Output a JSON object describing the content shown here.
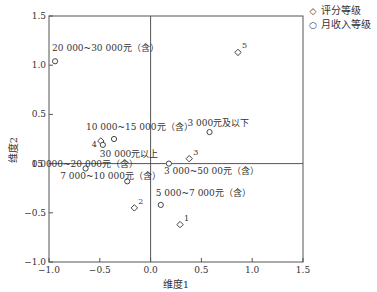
{
  "chart_data": {
    "type": "scatter",
    "title": "",
    "xlabel": "维度1",
    "ylabel": "维度2",
    "xlim": [
      -1.0,
      1.5
    ],
    "ylim": [
      -1.0,
      1.5
    ],
    "xticks": [
      "−1.0",
      "−0.5",
      "0.0",
      "0.5",
      "1.0",
      "1.5"
    ],
    "yticks": [
      "1.5",
      "1.0",
      "0.5",
      "0.0",
      "−0.5",
      "−1.0"
    ],
    "grid": false,
    "reference_lines": {
      "x": 0,
      "y": 0
    },
    "legend_position": "top-right outside",
    "series": [
      {
        "name": "评分等级",
        "marker": "diamond",
        "points": [
          {
            "label": "1",
            "x": 0.29,
            "y": -0.62
          },
          {
            "label": "2",
            "x": -0.16,
            "y": -0.45
          },
          {
            "label": "3",
            "x": 0.38,
            "y": 0.05
          },
          {
            "label": "4",
            "x": -0.49,
            "y": 0.23
          },
          {
            "label": "5",
            "x": 0.86,
            "y": 1.13
          }
        ]
      },
      {
        "name": "月收入等级",
        "marker": "circle",
        "points": [
          {
            "label": "3 000元及以下",
            "x": 0.58,
            "y": 0.32
          },
          {
            "label": "3 000~50 00元（含）",
            "x": 0.18,
            "y": 0.0
          },
          {
            "label": "5 000~7 000元（含）",
            "x": 0.1,
            "y": -0.42
          },
          {
            "label": "7 000~10 000元（含）",
            "x": -0.23,
            "y": -0.18
          },
          {
            "label": "10 000~15 000元（含）",
            "x": -0.36,
            "y": 0.25
          },
          {
            "label": "15 000~20 000元（含）",
            "x": -0.64,
            "y": -0.05
          },
          {
            "label": "20 000~30 000元（含）",
            "x": -0.94,
            "y": 1.04
          },
          {
            "label": "30 000元以上",
            "x": -0.47,
            "y": 0.19
          }
        ]
      }
    ]
  },
  "legend": {
    "items": [
      {
        "symbol": "◇",
        "label": "评分等级"
      },
      {
        "symbol": "○",
        "label": "月收入等级"
      }
    ]
  }
}
